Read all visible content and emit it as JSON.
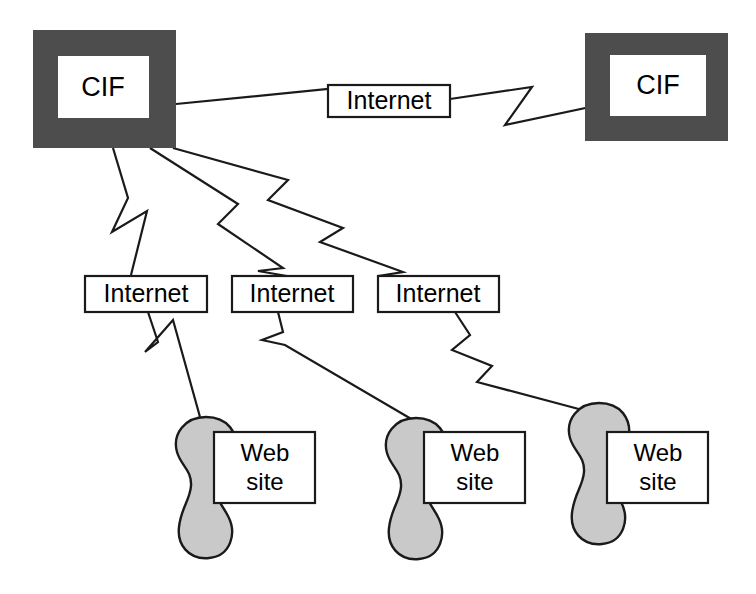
{
  "diagram": {
    "colors": {
      "cif_frame": "#4d4d4d",
      "blob_fill": "#c9c9c9",
      "line": "#1a1a1a",
      "box_fill": "#ffffff",
      "background": "#ffffff"
    },
    "nodes": {
      "cif_left": {
        "label": "CIF",
        "x": 33,
        "y": 30,
        "w": 143,
        "h": 118
      },
      "cif_right": {
        "label": "CIF",
        "x": 585,
        "y": 33,
        "w": 143,
        "h": 108
      },
      "internet_top": {
        "label": "Internet",
        "x": 328,
        "y": 85,
        "w": 122,
        "h": 32
      },
      "internet_mid_1": {
        "label": "Internet",
        "x": 85,
        "y": 276,
        "w": 122,
        "h": 36
      },
      "internet_mid_2": {
        "label": "Internet",
        "x": 232,
        "y": 276,
        "w": 121,
        "h": 36
      },
      "internet_mid_3": {
        "label": "Internet",
        "x": 378,
        "y": 276,
        "w": 121,
        "h": 36
      },
      "website_1": {
        "label_line1": "Web",
        "label_line2": "site",
        "x": 214,
        "y": 432,
        "w": 101,
        "h": 71
      },
      "website_2": {
        "label_line1": "Web",
        "label_line2": "site",
        "x": 424,
        "y": 432,
        "w": 101,
        "h": 71
      },
      "website_3": {
        "label_line1": "Web",
        "label_line2": "site",
        "x": 607,
        "y": 432,
        "w": 101,
        "h": 71
      }
    },
    "edges": [
      {
        "name": "cif-left-to-internet-top",
        "from": "cif_left",
        "to": "internet_top",
        "style": "lightning"
      },
      {
        "name": "internet-top-to-cif-right",
        "from": "internet_top",
        "to": "cif_right",
        "style": "lightning"
      },
      {
        "name": "cif-left-to-internet-mid-1",
        "from": "cif_left",
        "to": "internet_mid_1",
        "style": "lightning"
      },
      {
        "name": "cif-left-to-internet-mid-2",
        "from": "cif_left",
        "to": "internet_mid_2",
        "style": "lightning"
      },
      {
        "name": "cif-left-to-internet-mid-3",
        "from": "cif_left",
        "to": "internet_mid_3",
        "style": "lightning"
      },
      {
        "name": "internet-mid-1-to-website-1",
        "from": "internet_mid_1",
        "to": "website_1",
        "style": "lightning"
      },
      {
        "name": "internet-mid-2-to-website-2",
        "from": "internet_mid_2",
        "to": "website_2",
        "style": "lightning"
      },
      {
        "name": "internet-mid-3-to-website-3",
        "from": "internet_mid_3",
        "to": "website_3",
        "style": "lightning"
      }
    ],
    "paths": {
      "cif_left_to_internet_top": "M 176 104 L 358 86 L 336 110 L 450 99",
      "internet_top_to_cif_right": "M 450 99 L 532 87 L 505 125 L 628 99",
      "cif_left_to_internet_mid_1": "M 113 148 L 128 198 L 112 232 L 147 211 L 131 275",
      "cif_left_to_internet_mid_2": "M 150 148 L 238 204 L 218 224 L 283 268 L 258 271 L 287 276",
      "cif_left_to_internet_mid_3": "M 173 148 L 288 180 L 268 200 L 343 228 L 320 242 L 403 272 L 378 276 L 437 277",
      "internet_mid_1_to_website_1": "M 148 312 L 158 342 L 145 352 L 173 320 L 200 417",
      "internet_mid_2_to_website_2": "M 278 312 L 283 332 L 262 340 L 285 345 L 413 420",
      "internet_mid_3_to_website_3": "M 455 312 L 470 335 L 452 350 L 492 366 L 477 382 L 590 412"
    },
    "blobs": [
      {
        "name": "website-blob-1",
        "cx": 205,
        "cy": 465
      },
      {
        "name": "website-blob-2",
        "cx": 415,
        "cy": 465
      },
      {
        "name": "website-blob-3",
        "cx": 598,
        "cy": 465
      }
    ]
  }
}
